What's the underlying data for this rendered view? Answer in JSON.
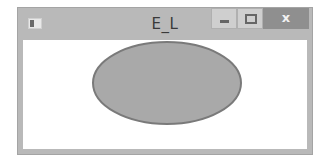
{
  "window": {
    "title": "E_L",
    "controls": {
      "minimize": "minimize",
      "maximize": "maximize",
      "close_label": "x"
    }
  },
  "canvas": {
    "shape": "ellipse",
    "fill": "#a9a9a9",
    "stroke": "#7a7a7a"
  }
}
